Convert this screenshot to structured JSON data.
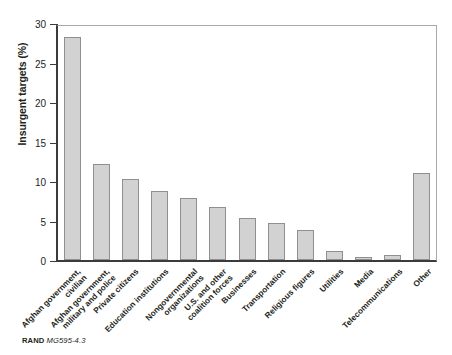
{
  "figure": {
    "source_prefix": "RAND",
    "source_number": "MG595-4.3"
  },
  "chart_data": {
    "type": "bar",
    "title": "",
    "xlabel": "",
    "ylabel": "Insurgent targets (%)",
    "ylim": [
      0,
      30
    ],
    "yticks": [
      0,
      5,
      10,
      15,
      20,
      25,
      30
    ],
    "ytick_labels": [
      "0",
      "5",
      "10",
      "15",
      "20",
      "25",
      "30"
    ],
    "grid": false,
    "legend": "none",
    "bar_color": "#d2d2d2",
    "bar_edge_color": "#8f8f8f",
    "axis_color": "#3b3b3b",
    "categories": [
      "Afghan government,\ncivilian",
      "Afghan government,\nmilitary and police",
      "Private citizens",
      "Education institutions",
      "Nongovernmental\norganizations",
      "U.S. and other\ncoalition forces",
      "Businesses",
      "Transportation",
      "Religious figures",
      "Utilities",
      "Media",
      "Telecommunications",
      "Other"
    ],
    "values": [
      28.2,
      12.2,
      10.2,
      8.7,
      7.8,
      6.7,
      5.3,
      4.7,
      3.8,
      1.2,
      0.4,
      0.6,
      11.0
    ]
  }
}
